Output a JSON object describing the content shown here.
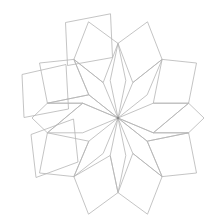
{
  "figure": {
    "background_color": "#ffffff",
    "stroke_color": "#b5b5b5",
    "center_dot_color": "#8a8a8a",
    "stroke_width": 0.8,
    "center": {
      "x": 118,
      "y": 118
    },
    "symmetry_order": 10,
    "canvas": {
      "width": 220,
      "height": 218
    },
    "inner_ring": {
      "count": 10,
      "name": "inner-rhombus",
      "polygons": [
        "118,118 110.2,80.5 118,43.4 125.8,80.5",
        "118,118 132.8,82.6 162.1,59.4 147.2,94.8",
        "118,118 153.3,103.2 188.6,103.2 153.3,132.8",
        "118,118 162.1,176.6 147.2,141.2 132.8,153.4",
        "118,118 125.8,155.5 118,192.6 110.2,155.5",
        "118,118 103.2,153.4 73.9,176.6 88.8,141.2",
        "118,118 82.7,132.8 47.4,132.8 82.7,103.2",
        "118,118 88.8,94.8 73.9,59.4 103.2,82.6"
      ],
      "spokes": [
        "118,118 118,43.4",
        "118,118 162.1,59.4",
        "118,118 188.6,103.2",
        "118,118 188.6,132.8",
        "118,118 162.1,176.6",
        "118,118 118,192.6",
        "118,118 73.9,176.6",
        "118,118 47.4,132.8",
        "118,118 47.4,103.2",
        "118,118 73.9,59.4"
      ]
    },
    "outer_ring": {
      "count": 10,
      "name": "outer-rhombus"
    },
    "detached_squares": {
      "count": 3,
      "name": "detached-square",
      "items": [
        {
          "label": "top-left-square",
          "cx": 88,
          "cy": 36,
          "size": 48,
          "rotation": -11
        },
        {
          "label": "left-square",
          "cx": 45,
          "cy": 86,
          "size": 48,
          "rotation": 6
        },
        {
          "label": "bottom-left-square",
          "cx": 52,
          "cy": 146,
          "size": 48,
          "rotation": -13
        }
      ]
    }
  }
}
